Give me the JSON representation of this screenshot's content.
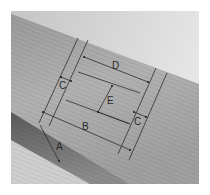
{
  "figure": {
    "labels": {
      "a": "A",
      "b": "B",
      "c_left": "C",
      "c_right": "C",
      "d": "D",
      "e": "E"
    },
    "colors": {
      "background": "#ffffff",
      "sky": "#d9d9d9",
      "beam_face": "#a8a8a8",
      "beam_side": "#6e6e6e",
      "pencil": "#2a2a2a"
    }
  }
}
